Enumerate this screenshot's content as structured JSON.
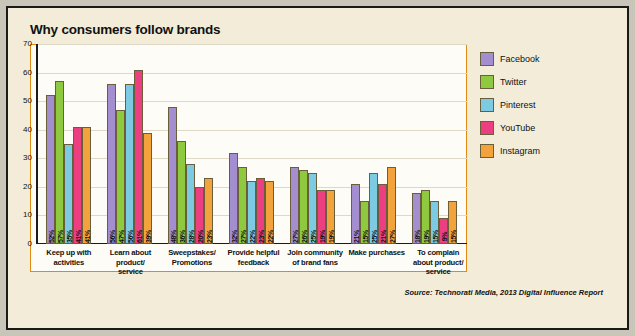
{
  "chart_data": {
    "type": "bar",
    "title": "Why consumers follow brands",
    "xlabel": "",
    "ylabel": "",
    "ylim": [
      0,
      70
    ],
    "yticks": [
      0,
      10,
      20,
      30,
      40,
      50,
      60,
      70
    ],
    "grid": true,
    "legend_position": "right",
    "categories": [
      "Keep up with activities",
      "Learn about product/ service",
      "Sweepstakes/ Promotions",
      "Provide helpful feedback",
      "Join community of brand fans",
      "Make purchases",
      "To complain about product/ service"
    ],
    "category_lines": [
      [
        "Keep up with",
        "activities"
      ],
      [
        "Learn about",
        "product/",
        "service"
      ],
      [
        "Sweepstakes/",
        "Promotions"
      ],
      [
        "Provide helpful",
        "feedback"
      ],
      [
        "Join community",
        "of brand fans"
      ],
      [
        "Make purchases"
      ],
      [
        "To complain",
        "about product/",
        "service"
      ]
    ],
    "series": [
      {
        "name": "Facebook",
        "color": "#a38fd0",
        "values": [
          52,
          56,
          48,
          32,
          27,
          21,
          18
        ],
        "labels": [
          "52%",
          "56%",
          "48%",
          "32%",
          "27%",
          "21%",
          "18%"
        ]
      },
      {
        "name": "Twitter",
        "color": "#8fc93f",
        "values": [
          57,
          47,
          36,
          27,
          26,
          15,
          19
        ],
        "labels": [
          "57%",
          "47%",
          "36%",
          "27%",
          "26%",
          "15%",
          "19%"
        ]
      },
      {
        "name": "Pinterest",
        "color": "#7dcbe3",
        "values": [
          35,
          56,
          28,
          22,
          25,
          25,
          15
        ],
        "labels": [
          "35%",
          "56%",
          "28%",
          "22%",
          "25%",
          "25%",
          "15%"
        ]
      },
      {
        "name": "YouTube",
        "color": "#ec3f82",
        "values": [
          41,
          61,
          20,
          23,
          19,
          21,
          9
        ],
        "labels": [
          "41%",
          "61%",
          "20%",
          "23%",
          "19%",
          "21%",
          "9%"
        ]
      },
      {
        "name": "Instagram",
        "color": "#f2a33c",
        "values": [
          41,
          39,
          23,
          22,
          19,
          27,
          15
        ],
        "labels": [
          "41%",
          "39%",
          "23%",
          "22%",
          "19%",
          "27%",
          "15%"
        ]
      }
    ],
    "source": "Source: Technorati Media, 2013 Digital Influence Report"
  }
}
